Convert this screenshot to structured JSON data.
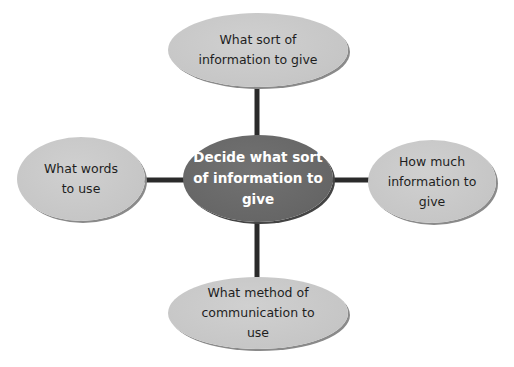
{
  "diagram": {
    "type": "spider-diagram",
    "central": {
      "text": "Decide what sort\nof information to\ngive"
    },
    "branches": [
      {
        "position": "top",
        "text": "What sort of\ninformation to give"
      },
      {
        "position": "right",
        "text": "How much\ninformation to\ngive"
      },
      {
        "position": "bottom",
        "text": "What method of\ncommunication to\nuse"
      },
      {
        "position": "left",
        "text": "What words\nto use"
      }
    ],
    "colors": {
      "central_fill": "#6b6b6b",
      "branch_fill": "#c8c8c8",
      "connector": "#2a2a2a",
      "central_text": "#ffffff",
      "branch_text": "#1e1e1e"
    }
  }
}
